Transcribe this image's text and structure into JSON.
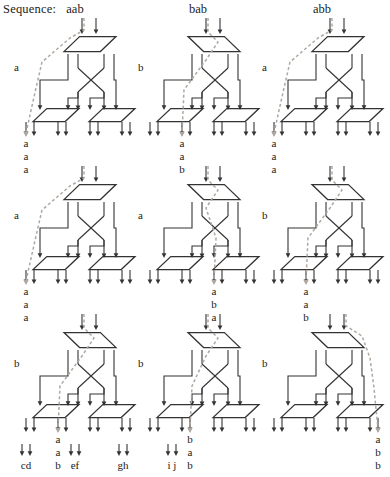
{
  "header": {
    "sequence_label": "Sequence:",
    "columns": [
      "aab",
      "bab",
      "abb"
    ]
  },
  "figure": {
    "type": "routing-network-grid",
    "rows": 3,
    "cols": 3,
    "node_shape": "parallelogram",
    "stage_count": 2,
    "inputs_per_panel": 2,
    "outputs_per_panel": 8,
    "output_group_count": 4,
    "line_color": "#333333",
    "highlight_color": "#b0a8a0",
    "highlight_style": "dashed"
  },
  "panels": [
    {
      "id": "r1c1",
      "row": 0,
      "col": 0,
      "sequence": "aab",
      "state_label": "a",
      "output_letters": [
        "a",
        "a",
        "a"
      ],
      "highlight_exit_group": 0,
      "highlight_exit_side": "left",
      "top_node_mirrored": false
    },
    {
      "id": "r1c2",
      "row": 0,
      "col": 1,
      "sequence": "bab",
      "state_label": "b",
      "output_letters": [
        "a",
        "a",
        "b"
      ],
      "highlight_exit_group": 1,
      "highlight_exit_side": "left",
      "top_node_mirrored": true
    },
    {
      "id": "r1c3",
      "row": 0,
      "col": 2,
      "sequence": "abb",
      "state_label": "a",
      "output_letters": [
        "a",
        "a",
        "a"
      ],
      "highlight_exit_group": 0,
      "highlight_exit_side": "left",
      "top_node_mirrored": false
    },
    {
      "id": "r2c1",
      "row": 1,
      "col": 0,
      "sequence": "aab",
      "state_label": "a",
      "output_letters": [
        "a",
        "a",
        "a"
      ],
      "highlight_exit_group": 0,
      "highlight_exit_side": "left",
      "top_node_mirrored": false
    },
    {
      "id": "r2c2",
      "row": 1,
      "col": 1,
      "sequence": "bab",
      "state_label": "a",
      "output_letters": [
        "a",
        "b",
        "a"
      ],
      "highlight_exit_group": 2,
      "highlight_exit_side": "left",
      "top_node_mirrored": true
    },
    {
      "id": "r2c3",
      "row": 1,
      "col": 2,
      "sequence": "abb",
      "state_label": "b",
      "output_letters": [
        "a",
        "a",
        "b"
      ],
      "highlight_exit_group": 1,
      "highlight_exit_side": "left",
      "top_node_mirrored": true
    },
    {
      "id": "r3c1",
      "row": 2,
      "col": 0,
      "sequence": "aab",
      "state_label": "b",
      "output_letters": [
        "a",
        "a",
        "b"
      ],
      "highlight_exit_group": 1,
      "highlight_exit_side": "left",
      "top_node_mirrored": true
    },
    {
      "id": "r3c2",
      "row": 2,
      "col": 1,
      "sequence": "bab",
      "state_label": "b",
      "output_letters": [
        "b",
        "a",
        "b"
      ],
      "highlight_exit_group": 1,
      "highlight_exit_side": "right",
      "top_node_mirrored": true
    },
    {
      "id": "r3c3",
      "row": 2,
      "col": 2,
      "sequence": "abb",
      "state_label": "b",
      "output_letters": [
        "a",
        "b",
        "b"
      ],
      "highlight_exit_group": 3,
      "highlight_exit_side": "right",
      "top_node_mirrored": true
    }
  ],
  "footer": {
    "groups": [
      "cd",
      "ef",
      "gh",
      "i j"
    ]
  }
}
